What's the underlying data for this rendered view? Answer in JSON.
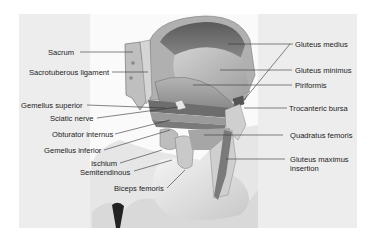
{
  "figure": {
    "labels_left": [
      {
        "id": "sacrum",
        "text": "Sacrum"
      },
      {
        "id": "sacrotuberous",
        "text": "Sacrotuberous ligament"
      },
      {
        "id": "gemellus-superior",
        "text": "Gemellus superior"
      },
      {
        "id": "sciatic-nerve",
        "text": "Sciatic nerve"
      },
      {
        "id": "obturator-internus",
        "text": "Obturator internus"
      },
      {
        "id": "gemellus-inferior",
        "text": "Gemellus inferior"
      },
      {
        "id": "ischium",
        "text": "Ischium"
      },
      {
        "id": "semitendinous",
        "text": "Semitendinous"
      },
      {
        "id": "biceps-femoris",
        "text": "Biceps femoris"
      }
    ],
    "labels_right": [
      {
        "id": "gluteus-medius",
        "text": "Gluteus medius"
      },
      {
        "id": "gluteus-minimus",
        "text": "Gluteus minimus"
      },
      {
        "id": "piriformis",
        "text": "Piriformis"
      },
      {
        "id": "trochanteric-bursa",
        "text": "Trocanteric bursa"
      },
      {
        "id": "quadratus-femoris",
        "text": "Quadratus femoris"
      },
      {
        "id": "gluteus-maximus-insertion-1",
        "text": "Gluteus maximus"
      },
      {
        "id": "gluteus-maximus-insertion-2",
        "text": "insertion"
      }
    ]
  }
}
